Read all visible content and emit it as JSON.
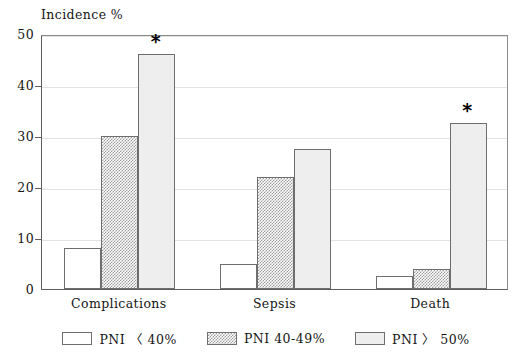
{
  "chart_data": {
    "type": "bar",
    "title": "",
    "ylabel": "Incidence %",
    "xlabel": "",
    "ylim": [
      0,
      50
    ],
    "yticks": [
      0,
      10,
      20,
      30,
      40,
      50
    ],
    "ytick_labels": [
      "0",
      "10",
      "20",
      "30",
      "40",
      "50"
    ],
    "grid": true,
    "legend_position": "bottom-center",
    "categories": [
      "Complications",
      "Sepsis",
      "Death"
    ],
    "series": [
      {
        "name": "PNI 〈 40%",
        "fill": "white",
        "color": "#ffffff",
        "values": [
          8,
          5,
          2.5
        ],
        "significant": [
          false,
          false,
          false
        ]
      },
      {
        "name": "PNI 40-49%",
        "fill": "hatched",
        "color": "#9b9b9b",
        "values": [
          30,
          22,
          4
        ],
        "significant": [
          false,
          false,
          false
        ]
      },
      {
        "name": "PNI 〉 50%",
        "fill": "light-gray",
        "color": "#eeeeee",
        "values": [
          46,
          27.5,
          32.5
        ],
        "significant": [
          true,
          false,
          true
        ]
      }
    ],
    "annotations": [
      {
        "symbol": "*",
        "category": "Complications",
        "series": "PNI 〉 50%"
      },
      {
        "symbol": "*",
        "category": "Death",
        "series": "PNI 〉 50%"
      }
    ]
  },
  "legend": {
    "items": [
      {
        "label": "PNI 〈 40%",
        "style": "white"
      },
      {
        "label": "PNI 40-49%",
        "style": "hatched"
      },
      {
        "label": "PNI 〉 50%",
        "style": "light-gray"
      }
    ]
  }
}
